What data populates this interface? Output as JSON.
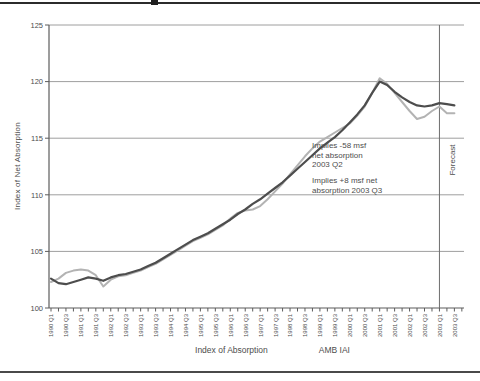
{
  "colors": {
    "series_dark": "#4d4d4d",
    "series_light": "#b3b3b3",
    "gridline": "#9e9e9e",
    "axis": "#5c5c5c",
    "text": "#4d4d4d",
    "forecast_line": "#6e6e6e",
    "background": "#ffffff"
  },
  "chart_data": {
    "type": "line",
    "title": "",
    "xlabel": "",
    "ylabel": "Index of Net Absorption",
    "ylim": [
      100,
      125
    ],
    "yticks": [
      100,
      105,
      110,
      115,
      120,
      125
    ],
    "grid": "horizontal",
    "legend_position": "bottom",
    "x_label_every": 2,
    "categories": [
      "1990 Q1",
      "1990 Q2",
      "1990 Q3",
      "1990 Q4",
      "1991 Q1",
      "1991 Q2",
      "1991 Q3",
      "1991 Q4",
      "1992 Q1",
      "1992 Q2",
      "1992 Q3",
      "1992 Q4",
      "1993 Q1",
      "1993 Q2",
      "1993 Q3",
      "1993 Q4",
      "1994 Q1",
      "1994 Q2",
      "1994 Q3",
      "1994 Q4",
      "1995 Q1",
      "1995 Q2",
      "1995 Q3",
      "1995 Q4",
      "1996 Q1",
      "1996 Q2",
      "1996 Q3",
      "1996 Q4",
      "1997 Q1",
      "1997 Q2",
      "1997 Q3",
      "1997 Q4",
      "1998 Q1",
      "1998 Q2",
      "1998 Q3",
      "1998 Q4",
      "1999 Q1",
      "1999 Q2",
      "1999 Q3",
      "1999 Q4",
      "2000 Q1",
      "2000 Q2",
      "2000 Q3",
      "2000 Q4",
      "2001 Q1",
      "2001 Q2",
      "2001 Q3",
      "2001 Q4",
      "2002 Q1",
      "2002 Q2",
      "2002 Q3",
      "2002 Q4",
      "2003 Q1",
      "2003 Q2",
      "2003 Q3"
    ],
    "series": [
      {
        "name": "Index of Absorption",
        "color": "#4d4d4d",
        "values": [
          102.6,
          102.2,
          102.1,
          102.3,
          102.5,
          102.7,
          102.6,
          102.4,
          102.7,
          102.9,
          103.0,
          103.2,
          103.4,
          103.7,
          104.0,
          104.4,
          104.8,
          105.2,
          105.6,
          106.0,
          106.3,
          106.6,
          107.0,
          107.4,
          107.8,
          108.3,
          108.7,
          109.2,
          109.6,
          110.1,
          110.6,
          111.1,
          111.7,
          112.3,
          112.9,
          113.5,
          114.1,
          114.6,
          115.1,
          115.7,
          116.4,
          117.1,
          117.9,
          119.0,
          120.0,
          119.7,
          119.1,
          118.6,
          118.2,
          117.9,
          117.8,
          117.9,
          118.1,
          118.0,
          117.9
        ]
      },
      {
        "name": "AMB IAI",
        "color": "#b3b3b3",
        "values": [
          102.3,
          102.6,
          103.1,
          103.3,
          103.4,
          103.3,
          102.9,
          101.9,
          102.5,
          102.8,
          102.9,
          103.1,
          103.3,
          103.6,
          103.9,
          104.3,
          104.7,
          105.1,
          105.5,
          105.9,
          106.2,
          106.5,
          106.9,
          107.3,
          107.9,
          108.4,
          108.6,
          108.7,
          109.0,
          109.6,
          110.3,
          111.0,
          111.8,
          112.6,
          113.4,
          114.1,
          114.7,
          115.1,
          115.5,
          115.9,
          116.3,
          117.0,
          117.8,
          119.0,
          120.3,
          119.8,
          119.0,
          118.2,
          117.4,
          116.7,
          116.9,
          117.4,
          117.8,
          117.2,
          117.2
        ]
      }
    ],
    "annotations": [
      {
        "text": "Implies -58 msf\nnet absorption\n2003 Q2"
      },
      {
        "text": "Implies +8 msf net\nabsorption 2003 Q3"
      }
    ],
    "forecast": {
      "label": "Forecast",
      "at_category": "2003 Q1"
    }
  },
  "legend": {
    "items": [
      {
        "label": "Index of Absorption",
        "color": "#4d4d4d"
      },
      {
        "label": "AMB IAI",
        "color": "#b3b3b3"
      }
    ]
  }
}
